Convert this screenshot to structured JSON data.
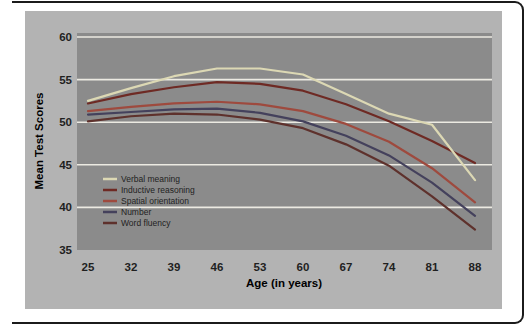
{
  "figure_type": "scanned textbook line chart",
  "chart_data": {
    "type": "line",
    "title": "",
    "xlabel": "Age (in years)",
    "ylabel": "Mean Test Scores",
    "x": [
      25,
      32,
      39,
      46,
      53,
      60,
      67,
      74,
      81,
      88
    ],
    "x_tick_labels": [
      "25",
      "32",
      "39",
      "46",
      "53",
      "60",
      "67",
      "74",
      "81",
      "88"
    ],
    "y_tick_labels": [
      "60",
      "55",
      "50",
      "45",
      "40",
      "35"
    ],
    "y_ticks": [
      60,
      55,
      50,
      45,
      40,
      35
    ],
    "ylim": [
      35,
      60
    ],
    "gridline_values": [
      60,
      55,
      50,
      45,
      40
    ],
    "grid": "horizontal light lines",
    "legend_position": "inside lower-left",
    "series": [
      {
        "name": "Verbal meaning",
        "color": "#dcd8b4",
        "values": [
          52.5,
          54.0,
          55.4,
          56.3,
          56.3,
          55.6,
          53.3,
          51.0,
          49.7,
          43.2
        ]
      },
      {
        "name": "Inductive reasoning",
        "color": "#6e2a24",
        "values": [
          52.2,
          53.3,
          54.1,
          54.7,
          54.5,
          53.7,
          52.1,
          50.1,
          47.8,
          45.2
        ]
      },
      {
        "name": "Spatial orientation",
        "color": "#9e4a3e",
        "values": [
          51.3,
          51.8,
          52.2,
          52.4,
          52.1,
          51.3,
          49.8,
          47.7,
          44.6,
          40.6
        ]
      },
      {
        "name": "Number",
        "color": "#44415c",
        "values": [
          50.9,
          51.2,
          51.5,
          51.6,
          51.1,
          50.1,
          48.4,
          46.1,
          42.9,
          39.0
        ]
      },
      {
        "name": "Word fluency",
        "color": "#5e312c",
        "values": [
          50.1,
          50.7,
          51.0,
          50.9,
          50.3,
          49.3,
          47.4,
          44.9,
          41.3,
          37.4
        ]
      }
    ]
  },
  "style": {
    "page_bg": "#ffffff",
    "figure_bg": "#b3b3b3",
    "plot_bg": "#8b8b8b",
    "grid_color": "#eceae2",
    "frame_color": "#1b1b1b",
    "text_color": "#1f1f1f"
  }
}
